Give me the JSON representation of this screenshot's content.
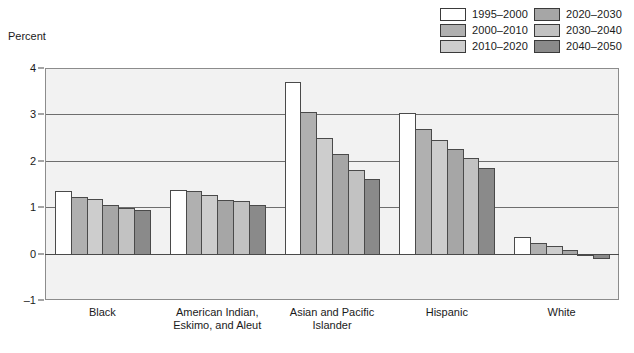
{
  "y_axis_title": "Percent",
  "legend": [
    {
      "label": "1995–2000",
      "color": "#ffffff"
    },
    {
      "label": "2020–2030",
      "color": "#a6a6a6"
    },
    {
      "label": "2000–2010",
      "color": "#b0b0b0"
    },
    {
      "label": "2030–2040",
      "color": "#c2c2c2"
    },
    {
      "label": "2010–2020",
      "color": "#cdcdcd"
    },
    {
      "label": "2040–2050",
      "color": "#8a8a8a"
    }
  ],
  "chart_data": {
    "type": "bar",
    "title": "",
    "xlabel": "",
    "ylabel": "Percent",
    "ylim": [
      -1,
      4
    ],
    "yticks": [
      4,
      3,
      2,
      1,
      0,
      -1
    ],
    "ytick_labels": [
      "4",
      "3",
      "2",
      "1",
      "0",
      "–1"
    ],
    "grid": true,
    "legend_position": "top-right",
    "categories": [
      "Black",
      "American Indian,\nEskimo, and Aleut",
      "Asian and Pacific\nIslander",
      "Hispanic",
      "White"
    ],
    "series": [
      {
        "name": "1995–2000",
        "color": "#ffffff",
        "values": [
          1.35,
          1.37,
          3.7,
          3.03,
          0.35
        ]
      },
      {
        "name": "2000–2010",
        "color": "#b0b0b0",
        "values": [
          1.22,
          1.35,
          3.05,
          2.68,
          0.22
        ]
      },
      {
        "name": "2010–2020",
        "color": "#cdcdcd",
        "values": [
          1.17,
          1.27,
          2.5,
          2.45,
          0.17
        ]
      },
      {
        "name": "2020–2030",
        "color": "#a6a6a6",
        "values": [
          1.05,
          1.16,
          2.15,
          2.25,
          0.07
        ]
      },
      {
        "name": "2030–2040",
        "color": "#c2c2c2",
        "values": [
          0.98,
          1.13,
          1.8,
          2.05,
          0.0
        ]
      },
      {
        "name": "2040–2050",
        "color": "#8a8a8a",
        "values": [
          0.95,
          1.05,
          1.6,
          1.85,
          -0.1
        ]
      }
    ]
  }
}
